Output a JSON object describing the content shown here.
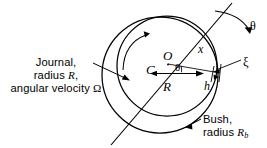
{
  "figure": {
    "type": "journal-bearing-cross-section",
    "background_color": "#ffffff",
    "stroke_color": "#000000"
  },
  "labels": {
    "journal": {
      "line1": "Journal,",
      "line2_prefix": "radius ",
      "line2_symbol": "R",
      "line2_suffix": ",",
      "line3_prefix": "angular velocity ",
      "line3_symbol": "Ω"
    },
    "bush": {
      "line1": "Bush,",
      "line2_prefix": "radius ",
      "line2_symbol": "R",
      "line2_subscript": "b"
    }
  },
  "symbols": {
    "bush_center": "C",
    "journal_center": "O",
    "journal_radius": "R",
    "coordinate_x": "x",
    "film_thickness": "h",
    "xi": "ξ",
    "theta_center": "θ",
    "theta_circumferential": "θ",
    "omega": "Ω"
  },
  "geometry": {
    "bush_circle": {
      "cx": 160,
      "cy": 75,
      "r": 58
    },
    "journal_circle": {
      "cx": 167,
      "cy": 66,
      "r": 50
    },
    "line_of_centers": {
      "x1": 232,
      "y1": 3,
      "x2": 111,
      "y2": 145
    },
    "radius_arrow": {
      "x1": 153,
      "y1": 73,
      "x2": 201,
      "y2": 73
    },
    "eccentricity_label_positions": {
      "C": [
        146,
        62
      ],
      "O": [
        163,
        48
      ],
      "R": [
        163,
        79
      ],
      "x": [
        198,
        42
      ],
      "h": [
        204,
        79
      ],
      "xi": [
        243,
        55
      ],
      "theta_at_center": [
        175,
        61
      ],
      "theta_top_right": [
        250,
        19
      ]
    }
  },
  "annotations": {
    "rotation_arc": "counter-clockwise rotation arrow inside journal",
    "theta_arc": "circumferential angle arc arrow at top right",
    "journal_leader": "arrow from journal label to journal surface",
    "bush_leader": "arrow from bush label to bush surface",
    "xi_leader": "leader line from xi to film location"
  }
}
